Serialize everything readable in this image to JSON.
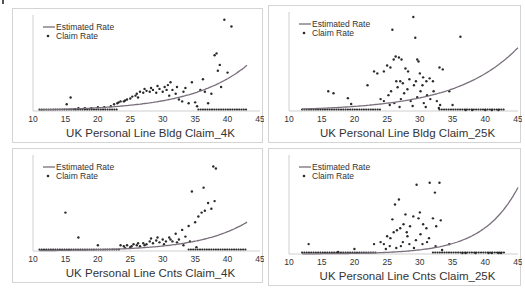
{
  "colors": {
    "line": "#7a6f7c",
    "dot": "#2a2a2a",
    "axis": "#cfcfcf",
    "text": "#333333"
  },
  "legend": {
    "line_label": "Estimated Rate",
    "dot_label": "Claim Rate"
  },
  "chart_data": [
    {
      "type": "scatter",
      "title": "UK Personal Line Bldg Claim_4K",
      "xlabel": "UK Personal Line Bldg Claim_4K",
      "xlim": [
        10,
        45
      ],
      "xticks": [
        10,
        15,
        20,
        25,
        30,
        35,
        40,
        45
      ],
      "ylim": [
        0,
        1
      ],
      "legend": [
        "Estimated Rate",
        "Claim Rate"
      ],
      "line": {
        "name": "Estimated Rate",
        "a": 0.012,
        "b": 0.115,
        "x0": 11,
        "x1": 43
      },
      "zero_band": [
        [
          11,
          23
        ],
        [
          35.5,
          43
        ]
      ],
      "points": [
        [
          15.2,
          0.07
        ],
        [
          15.8,
          0.14
        ],
        [
          16.5,
          0.02
        ],
        [
          17,
          0.03
        ],
        [
          18,
          0.03
        ],
        [
          19,
          0.03
        ],
        [
          20,
          0.04
        ],
        [
          21,
          0.04
        ],
        [
          22,
          0.05
        ],
        [
          22.5,
          0.07
        ],
        [
          23,
          0.08
        ],
        [
          23.5,
          0.1
        ],
        [
          24,
          0.1
        ],
        [
          24.5,
          0.12
        ],
        [
          25,
          0.13
        ],
        [
          25.3,
          0.15
        ],
        [
          25.8,
          0.16
        ],
        [
          26,
          0.18
        ],
        [
          26.5,
          0.2
        ],
        [
          27,
          0.19
        ],
        [
          27.5,
          0.21
        ],
        [
          28,
          0.2
        ],
        [
          28.5,
          0.22
        ],
        [
          29,
          0.19
        ],
        [
          29.5,
          0.23
        ],
        [
          30,
          0.2
        ],
        [
          30.3,
          0.25
        ],
        [
          30.8,
          0.27
        ],
        [
          31,
          0.16
        ],
        [
          31.5,
          0.22
        ],
        [
          32,
          0.18
        ],
        [
          32.5,
          0.12
        ],
        [
          33,
          0.1
        ],
        [
          33.5,
          0.24
        ],
        [
          34,
          0.08
        ],
        [
          34.5,
          0.3
        ],
        [
          35,
          0.09
        ],
        [
          35.3,
          0.05
        ],
        [
          35.8,
          0.22
        ],
        [
          36.2,
          0.33
        ],
        [
          36.5,
          0.2
        ],
        [
          37,
          0.08
        ],
        [
          37.5,
          0.18
        ],
        [
          38,
          0.58
        ],
        [
          38.3,
          0.6
        ],
        [
          38.5,
          0.42
        ],
        [
          38.8,
          0.48
        ],
        [
          39,
          0.25
        ],
        [
          39.5,
          0.95
        ],
        [
          40,
          0.4
        ],
        [
          40.6,
          0.88
        ],
        [
          23.2,
          0.09
        ],
        [
          24.2,
          0.11
        ],
        [
          26.2,
          0.14
        ],
        [
          27.2,
          0.23
        ],
        [
          28.2,
          0.24
        ],
        [
          29.2,
          0.26
        ],
        [
          30.6,
          0.22
        ],
        [
          31.2,
          0.3
        ],
        [
          32.2,
          0.25
        ],
        [
          33.2,
          0.2
        ]
      ]
    },
    {
      "type": "scatter",
      "title": "UK Personal Line Bldg Claim_25K",
      "xlabel": "UK Personal Line Bldg Claim_25K",
      "xlim": [
        10,
        45
      ],
      "xticks": [
        10,
        15,
        20,
        25,
        30,
        35,
        40,
        45
      ],
      "ylim": [
        0,
        1
      ],
      "legend": [
        "Estimated Rate",
        "Claim Rate"
      ],
      "line": {
        "name": "Estimated Rate",
        "a": 0.02,
        "b": 0.105,
        "x0": 12,
        "x1": 45
      },
      "zero_band": [
        [
          12,
          24
        ],
        [
          33,
          43
        ]
      ],
      "points": [
        [
          16,
          0.2
        ],
        [
          16.8,
          0.18
        ],
        [
          19,
          0.13
        ],
        [
          19.5,
          0.07
        ],
        [
          22,
          0.26
        ],
        [
          23,
          0.4
        ],
        [
          23.5,
          0.38
        ],
        [
          24.5,
          0.4
        ],
        [
          25,
          0.46
        ],
        [
          25.5,
          0.44
        ],
        [
          25.8,
          0.82
        ],
        [
          26,
          0.52
        ],
        [
          26.3,
          0.55
        ],
        [
          26.8,
          0.54
        ],
        [
          27,
          0.3
        ],
        [
          27.2,
          0.52
        ],
        [
          27.8,
          0.43
        ],
        [
          28.2,
          0.4
        ],
        [
          29,
          0.95
        ],
        [
          29.3,
          0.74
        ],
        [
          29.6,
          0.52
        ],
        [
          29.8,
          0.5
        ],
        [
          30,
          0.38
        ],
        [
          30.5,
          0.34
        ],
        [
          31,
          0.3
        ],
        [
          31.5,
          0.33
        ],
        [
          32,
          0.3
        ],
        [
          33,
          0.44
        ],
        [
          33.5,
          0.42
        ],
        [
          34.5,
          0.2
        ],
        [
          35,
          0.06
        ],
        [
          36.2,
          0.75
        ],
        [
          24,
          0.12
        ],
        [
          24.5,
          0.1
        ],
        [
          25.2,
          0.16
        ],
        [
          25.6,
          0.2
        ],
        [
          26.1,
          0.08
        ],
        [
          26.6,
          0.24
        ],
        [
          27.1,
          0.12
        ],
        [
          27.6,
          0.18
        ],
        [
          28.1,
          0.22
        ],
        [
          28.6,
          0.1
        ],
        [
          29.1,
          0.26
        ],
        [
          29.6,
          0.14
        ],
        [
          30.1,
          0.2
        ],
        [
          30.6,
          0.08
        ],
        [
          31.1,
          0.16
        ],
        [
          31.6,
          0.12
        ],
        [
          32.1,
          0.2
        ],
        [
          32.6,
          0.1
        ],
        [
          33.1,
          0.06
        ],
        [
          26.4,
          0.3
        ],
        [
          27.4,
          0.28
        ],
        [
          28.4,
          0.32
        ],
        [
          29.4,
          0.3
        ],
        [
          30.4,
          0.26
        ],
        [
          25.4,
          0.06
        ],
        [
          26.9,
          0.04
        ],
        [
          28.9,
          0.05
        ],
        [
          30.9,
          0.04
        ],
        [
          32.9,
          0.03
        ],
        [
          37,
          0.01
        ],
        [
          38,
          0.01
        ],
        [
          40,
          0.01
        ],
        [
          41,
          0.01
        ],
        [
          42,
          0.01
        ]
      ]
    },
    {
      "type": "scatter",
      "title": "UK Personal Line Cnts Claim_4K",
      "xlabel": "UK Personal Line Cnts Claim_4K",
      "xlim": [
        10,
        45
      ],
      "xticks": [
        10,
        15,
        20,
        25,
        30,
        35,
        40,
        45
      ],
      "ylim": [
        0,
        1
      ],
      "legend": [
        "Estimated Rate",
        "Claim Rate"
      ],
      "line": {
        "name": "Estimated Rate",
        "a": 0.004,
        "b": 0.135,
        "x0": 11,
        "x1": 43
      },
      "zero_band": [
        [
          11,
          23.5
        ],
        [
          34,
          43
        ]
      ],
      "points": [
        [
          15,
          0.4
        ],
        [
          17,
          0.14
        ],
        [
          20,
          0.06
        ],
        [
          23.5,
          0.06
        ],
        [
          24,
          0.05
        ],
        [
          24.5,
          0.06
        ],
        [
          25,
          0.04
        ],
        [
          25.5,
          0.07
        ],
        [
          26,
          0.06
        ],
        [
          26.5,
          0.05
        ],
        [
          27,
          0.08
        ],
        [
          27.5,
          0.07
        ],
        [
          28,
          0.1
        ],
        [
          28.5,
          0.08
        ],
        [
          29,
          0.11
        ],
        [
          29.5,
          0.09
        ],
        [
          30,
          0.12
        ],
        [
          30.5,
          0.1
        ],
        [
          31,
          0.14
        ],
        [
          31.5,
          0.1
        ],
        [
          32,
          0.18
        ],
        [
          32.5,
          0.12
        ],
        [
          33,
          0.22
        ],
        [
          33.5,
          0.15
        ],
        [
          34,
          0.26
        ],
        [
          34.5,
          0.62
        ],
        [
          35,
          0.3
        ],
        [
          35.5,
          0.36
        ],
        [
          36,
          0.4
        ],
        [
          36.3,
          0.66
        ],
        [
          36.5,
          0.42
        ],
        [
          37,
          0.5
        ],
        [
          37.5,
          0.44
        ],
        [
          37.8,
          0.88
        ],
        [
          38,
          0.52
        ],
        [
          38.2,
          0.86
        ],
        [
          24.2,
          0.03
        ],
        [
          25.2,
          0.05
        ],
        [
          26.2,
          0.08
        ],
        [
          27.2,
          0.06
        ],
        [
          28.2,
          0.13
        ],
        [
          29.2,
          0.14
        ],
        [
          30.2,
          0.07
        ],
        [
          31.2,
          0.12
        ],
        [
          32.2,
          0.09
        ],
        [
          33.2,
          0.06
        ],
        [
          34.2,
          0.1
        ],
        [
          35.2,
          0.04
        ]
      ]
    },
    {
      "type": "scatter",
      "title": "UK Personal Line Cnts Claim_25K",
      "xlabel": "UK Personal Line Cnts Claim_25K",
      "xlim": [
        10,
        45
      ],
      "xticks": [
        10,
        15,
        20,
        25,
        30,
        35,
        40,
        45
      ],
      "ylim": [
        0,
        1
      ],
      "legend": [
        "Estimated Rate",
        "Claim Rate"
      ],
      "line": {
        "name": "Estimated Rate",
        "a": 0.0015,
        "b": 0.185,
        "x0": 12,
        "x1": 45
      },
      "zero_band": [
        [
          12,
          23.5
        ],
        [
          32,
          43
        ]
      ],
      "points": [
        [
          13,
          0.1
        ],
        [
          17.5,
          0.02
        ],
        [
          20,
          0.05
        ],
        [
          23,
          0.1
        ],
        [
          24,
          0.12
        ],
        [
          24.5,
          0.1
        ],
        [
          25,
          0.18
        ],
        [
          25.5,
          0.16
        ],
        [
          25.8,
          0.35
        ],
        [
          26,
          0.22
        ],
        [
          26.5,
          0.24
        ],
        [
          26.8,
          0.55
        ],
        [
          27,
          0.26
        ],
        [
          27.5,
          0.3
        ],
        [
          27.8,
          0.4
        ],
        [
          28,
          0.22
        ],
        [
          28.5,
          0.28
        ],
        [
          29,
          0.38
        ],
        [
          29.5,
          0.7
        ],
        [
          29.8,
          0.36
        ],
        [
          30,
          0.42
        ],
        [
          30.5,
          0.3
        ],
        [
          31,
          0.26
        ],
        [
          31.5,
          0.72
        ],
        [
          32,
          0.36
        ],
        [
          32.3,
          0.62
        ],
        [
          32.5,
          0.28
        ],
        [
          33,
          0.72
        ],
        [
          33.2,
          0.34
        ],
        [
          34.5,
          0.1
        ],
        [
          26.2,
          0.5
        ],
        [
          24.8,
          0.05
        ],
        [
          25.4,
          0.08
        ],
        [
          26.4,
          0.06
        ],
        [
          27.4,
          0.12
        ],
        [
          28.4,
          0.1
        ],
        [
          29.4,
          0.14
        ],
        [
          30.4,
          0.1
        ],
        [
          31.4,
          0.16
        ],
        [
          32.4,
          0.08
        ],
        [
          33.4,
          0.04
        ],
        [
          27.1,
          0.08
        ],
        [
          28.1,
          0.18
        ],
        [
          29.1,
          0.06
        ],
        [
          30.1,
          0.2
        ],
        [
          31.1,
          0.12
        ],
        [
          36.5,
          0.01
        ],
        [
          37,
          0.01
        ],
        [
          38.5,
          0.01
        ],
        [
          40.5,
          0.01
        ],
        [
          41,
          0.01
        ],
        [
          42,
          0.01
        ],
        [
          42.4,
          0.01
        ]
      ]
    }
  ]
}
